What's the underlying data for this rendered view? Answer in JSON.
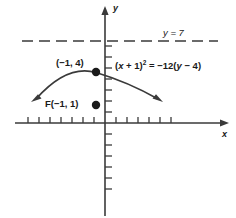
{
  "figure": {
    "type": "coordinate-plane-parabola-diagram",
    "background_color": "#ffffff",
    "ink_color": "#3a3a3a",
    "text_color": "#1a1a1a"
  },
  "axes": {
    "x_axis_label": "x",
    "y_axis_label": "y",
    "origin_px": [
      105,
      123
    ],
    "unit_px": 11,
    "x_range_px": [
      15,
      228
    ],
    "y_range_px": [
      8,
      216
    ],
    "x_ticks_left": 8,
    "x_ticks_right": 6,
    "y_ticks_up": 5,
    "y_ticks_down": 6
  },
  "directrix": {
    "label": "y = 7",
    "y_value": 7,
    "style": "dashed",
    "y_px": 41,
    "x_start_px": 22,
    "x_end_px": 218
  },
  "curve": {
    "equation_text_parts": {
      "left_paren": "(",
      "x": "x",
      "plus_one": " + 1)",
      "exponent": "2",
      "equals": " = ",
      "minus_twelve": "−12(",
      "y": "y",
      "minus_four": " − 4)"
    },
    "equation_plain": "(x + 1)² = −12(y − 4)",
    "opens": "downward",
    "vertex": [
      -1,
      4
    ],
    "focus": [
      -1,
      1
    ],
    "directrix_y": 7,
    "four_p": -12
  },
  "points": [
    {
      "name": "vertex",
      "label": "(−1, 4)",
      "coords": [
        -1,
        4
      ],
      "px": [
        96,
        72
      ],
      "dot": true
    },
    {
      "name": "focus",
      "label": "F(−1, 1)",
      "coords": [
        -1,
        1
      ],
      "px": [
        96,
        105
      ],
      "dot": true
    }
  ]
}
